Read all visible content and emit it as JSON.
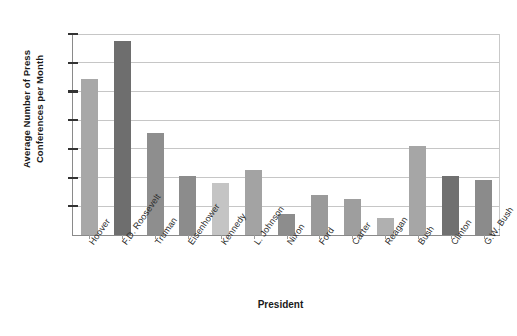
{
  "chart_data": {
    "type": "bar",
    "title": "",
    "xlabel": "President",
    "ylabel": "Average Number of Press Conferences per Month",
    "ylabel_line1": "Average Number of Press",
    "ylabel_line2": "Conferences per Month",
    "categories": [
      "Hoover",
      "F.D. Roosevelt",
      "Truman",
      "Eisenhower",
      "Kennedy",
      "L. Johnson",
      "Nixon",
      "Ford",
      "Carter",
      "Reagan",
      "Bush",
      "Clinton",
      "G.W. Bush"
    ],
    "values": [
      5.45,
      6.75,
      3.55,
      2.05,
      1.8,
      2.25,
      0.72,
      1.4,
      1.27,
      0.58,
      3.1,
      2.07,
      1.9
    ],
    "bar_colors": [
      "#a8a8a8",
      "#6e6e6e",
      "#8e8e8e",
      "#8c8c8c",
      "#c4c4c4",
      "#a3a3a3",
      "#8d8d8d",
      "#9a9a9a",
      "#9e9e9e",
      "#b0b0b0",
      "#a6a6a6",
      "#707070",
      "#8b8b8b"
    ],
    "yticks": [
      0,
      1,
      2,
      3,
      4,
      5,
      6,
      7
    ],
    "ylim": [
      0,
      7
    ],
    "grid": true,
    "legend": "none",
    "axis_color": "#8a8a8a",
    "grid_color": "#c6c6c6",
    "background": "#ffffff"
  }
}
